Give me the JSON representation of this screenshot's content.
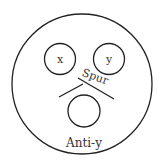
{
  "diagram": {
    "type": "immunodiffusion-plate",
    "stroke_color": "#222222",
    "wells": [
      {
        "id": "x",
        "label": "x"
      },
      {
        "id": "y",
        "label": "y"
      },
      {
        "id": "anti-y",
        "label": "Anti-y"
      }
    ],
    "annotation": {
      "label": "Spur"
    }
  }
}
